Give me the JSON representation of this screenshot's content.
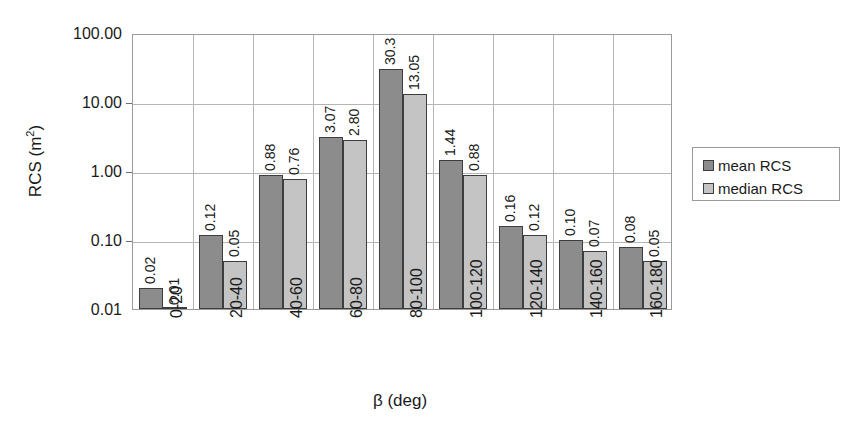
{
  "chart_data": {
    "type": "bar",
    "title": "",
    "xlabel": "β (deg)",
    "ylabel_text": "RCS (m",
    "ylabel_sup": "2",
    "ylabel_tail": ")",
    "ylabel_full": "RCS (m2)",
    "yscale": "log",
    "ylim": [
      0.01,
      100
    ],
    "grid": true,
    "legend_position": "right",
    "categories": [
      "0-20",
      "20-40",
      "40-60",
      "60-80",
      "80-100",
      "100-120",
      "120-140",
      "140-160",
      "160-180"
    ],
    "ytick_labels": [
      "100.00",
      "10.00",
      "1.00",
      "0.10",
      "0.01"
    ],
    "ytick_values": [
      100,
      10,
      1,
      0.1,
      0.01
    ],
    "series": [
      {
        "name": "mean RCS",
        "color": "#8c8c8c",
        "values": [
          0.02,
          0.12,
          0.88,
          3.07,
          30.3,
          1.44,
          0.16,
          0.1,
          0.08
        ],
        "labels": [
          "0.02",
          "0.12",
          "0.88",
          "3.07",
          "30.3",
          "1.44",
          "0.16",
          "0.10",
          "0.08"
        ]
      },
      {
        "name": "median RCS",
        "color": "#c4c4c4",
        "values": [
          0.01,
          0.05,
          0.76,
          2.8,
          13.05,
          0.88,
          0.12,
          0.07,
          0.05
        ],
        "labels": [
          "0.01",
          "0.05",
          "0.76",
          "2.80",
          "13.05",
          "0.88",
          "0.12",
          "0.07",
          "0.05"
        ]
      }
    ]
  },
  "legend": {
    "items": [
      {
        "label": "mean RCS",
        "swatch": "mean"
      },
      {
        "label": "median RCS",
        "swatch": "median"
      }
    ]
  },
  "axes": {
    "y_title": "RCS (m2)",
    "x_title": "β (deg)"
  }
}
